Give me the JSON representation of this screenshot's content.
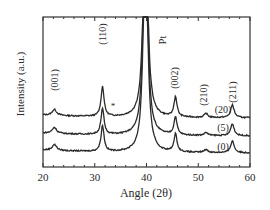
{
  "chart_data": {
    "type": "line",
    "title": "",
    "xlabel": "Angle (2θ)",
    "ylabel": "Intensity (a.u.)",
    "xlim": [
      20,
      60
    ],
    "xticks": [
      20,
      30,
      40,
      50,
      60
    ],
    "ylim": [
      0,
      1
    ],
    "grid": false,
    "legend_position": "inline-right",
    "series": [
      {
        "name": "(20)",
        "offset": 0.32,
        "peaks": [
          {
            "x": 22.2,
            "h": 0.06
          },
          {
            "x": 31.5,
            "h": 0.3
          },
          {
            "x": 39.8,
            "h": 1.0
          },
          {
            "x": 45.6,
            "h": 0.2
          },
          {
            "x": 51.5,
            "h": 0.04
          },
          {
            "x": 56.6,
            "h": 0.13
          }
        ]
      },
      {
        "name": "(5)",
        "offset": 0.2,
        "peaks": [
          {
            "x": 22.2,
            "h": 0.06
          },
          {
            "x": 31.5,
            "h": 0.26
          },
          {
            "x": 39.8,
            "h": 1.0
          },
          {
            "x": 45.6,
            "h": 0.18
          },
          {
            "x": 51.5,
            "h": 0.03
          },
          {
            "x": 56.6,
            "h": 0.12
          }
        ]
      },
      {
        "name": "(0)",
        "offset": 0.08,
        "peaks": [
          {
            "x": 22.2,
            "h": 0.06
          },
          {
            "x": 31.5,
            "h": 0.26
          },
          {
            "x": 39.8,
            "h": 1.0
          },
          {
            "x": 45.6,
            "h": 0.18
          },
          {
            "x": 51.5,
            "h": 0.03
          },
          {
            "x": 56.6,
            "h": 0.12
          }
        ]
      }
    ],
    "annotations": [
      {
        "text": "(001)",
        "x": 22.2,
        "rotated": true
      },
      {
        "text": "(110)",
        "x": 31.5,
        "rotated": true
      },
      {
        "text": "Pt",
        "x": 42.3,
        "rotated": true
      },
      {
        "text": "(002)",
        "x": 45.6,
        "rotated": true
      },
      {
        "text": "(210)",
        "x": 51.5,
        "rotated": true
      },
      {
        "text": "(211)",
        "x": 56.6,
        "rotated": true
      },
      {
        "text": "*",
        "x": 33.0
      }
    ]
  },
  "labels": {
    "xlabel": "Angle (2θ)",
    "ylabel": "Intensity (a.u.)",
    "xticks": [
      "20",
      "30",
      "40",
      "50",
      "60"
    ],
    "peaks": [
      "(001)",
      "(110)",
      "Pt",
      "(002)",
      "(210)",
      "(211)"
    ],
    "series": [
      "(20)",
      "(5)",
      "(0)"
    ],
    "star": "*"
  }
}
